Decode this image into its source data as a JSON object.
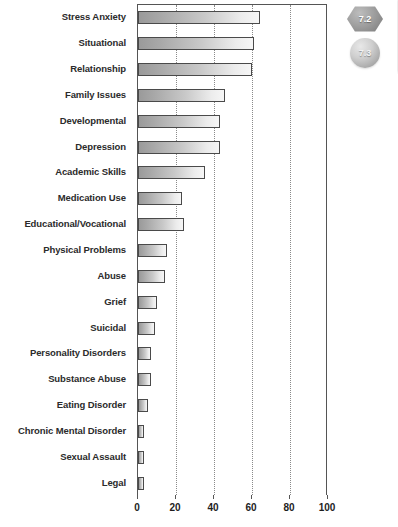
{
  "chart_data": {
    "type": "bar",
    "orientation": "horizontal",
    "title": "",
    "xlabel": "",
    "ylabel": "",
    "xlim": [
      0,
      100
    ],
    "grid": true,
    "legend": null,
    "xticks": [
      "0",
      "20",
      "40",
      "60",
      "80",
      "100"
    ],
    "xtick_values": [
      0,
      20,
      40,
      60,
      80,
      100
    ],
    "categories": [
      "Stress Anxiety",
      "Situational",
      "Relationship",
      "Family Issues",
      "Developmental",
      "Depression",
      "Academic Skills",
      "Medication Use",
      "Educational/Vocational",
      "Physical Problems",
      "Abuse",
      "Grief",
      "Suicidal",
      "Personality Disorders",
      "Substance Abuse",
      "Eating Disorder",
      "Chronic Mental Disorder",
      "Sexual Assault",
      "Legal"
    ],
    "values": [
      64,
      61,
      60,
      46,
      43,
      43,
      35,
      23,
      24,
      15,
      14,
      10,
      9,
      7,
      7,
      5,
      3,
      3,
      3
    ],
    "bar_color": "#b8b8b8",
    "bar_border_color": "#4a4a4a"
  },
  "badges": [
    {
      "label": "7.2",
      "shape": "hexagon"
    },
    {
      "label": "7.3",
      "shape": "circle"
    }
  ]
}
